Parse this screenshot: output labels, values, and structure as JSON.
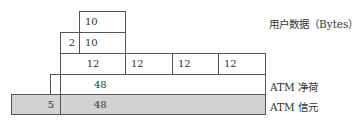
{
  "diagram": {
    "rows": [
      {
        "name": "user-data-row",
        "cells": [
          {
            "text": "10"
          }
        ]
      },
      {
        "name": "header-row",
        "cells": [
          {
            "text": "2"
          },
          {
            "text": "10"
          }
        ]
      },
      {
        "name": "split-row",
        "cells": [
          {
            "text": "12"
          },
          {
            "text": "12"
          },
          {
            "text": "12"
          },
          {
            "text": "12"
          }
        ]
      },
      {
        "name": "payload-row",
        "cells": [
          {
            "text": "48"
          }
        ]
      },
      {
        "name": "cell-row",
        "cells": [
          {
            "text": "5"
          },
          {
            "text": "48"
          }
        ]
      }
    ],
    "labels": {
      "user_data": "用户数据（Bytes）",
      "atm_payload": "ATM 净荷",
      "atm_cell": "ATM 信元"
    },
    "colors": {
      "border": "#555555",
      "cell_fill": "#d2d2d2"
    }
  }
}
